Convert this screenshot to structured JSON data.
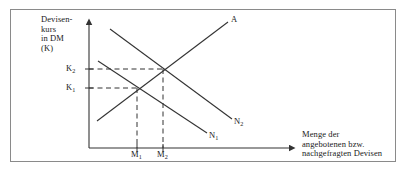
{
  "figure": {
    "kind": "economics-supply-demand-diagram",
    "frame_color": "#8a8a8a",
    "line_color": "#333333",
    "background": "#ffffff"
  },
  "axes": {
    "y_title_lines": [
      "Devisen-",
      "kurs",
      "in DM",
      "(K)"
    ],
    "y_title": "Devisen-\nkurs\nin DM\n(K)",
    "x_title_lines": [
      "Menge der",
      "angebotenen bzw.",
      "nachgefragten Devisen"
    ],
    "x_title": "Menge der\nangebotenen bzw.\nnachgefragten Devisen",
    "origin": {
      "x": 89,
      "y": 148
    },
    "y_axis_top": {
      "x": 89,
      "y": 20
    },
    "x_axis_right": {
      "x": 294,
      "y": 148
    },
    "arrowheads": [
      "y-axis-top",
      "x-axis-right"
    ]
  },
  "ticks": {
    "y": [
      {
        "label": "K",
        "sub": "2",
        "value_y": 69
      },
      {
        "label": "K",
        "sub": "1",
        "value_y": 88
      }
    ],
    "x": [
      {
        "label": "M",
        "sub": "1",
        "value_x": 137
      },
      {
        "label": "M",
        "sub": "2",
        "value_x": 163
      }
    ]
  },
  "curves": [
    {
      "name": "supply",
      "label": "A",
      "label_sub": "",
      "description": "upward sloping supply curve (Angebot)",
      "from": {
        "x": 97,
        "y": 121
      },
      "to": {
        "x": 228,
        "y": 22
      }
    },
    {
      "name": "demand-1",
      "label": "N",
      "label_sub": "1",
      "description": "original downward sloping demand curve",
      "from": {
        "x": 98,
        "y": 61
      },
      "to": {
        "x": 207,
        "y": 133
      }
    },
    {
      "name": "demand-2",
      "label": "N",
      "label_sub": "2",
      "description": "shifted-out downward sloping demand curve",
      "from": {
        "x": 110,
        "y": 29
      },
      "to": {
        "x": 232,
        "y": 119
      }
    }
  ],
  "equilibria": [
    {
      "name": "equilibrium-1",
      "x": 137,
      "y": 88,
      "price_tick": "K1",
      "quantity_tick": "M1"
    },
    {
      "name": "equilibrium-2",
      "x": 163,
      "y": 69,
      "price_tick": "K2",
      "quantity_tick": "M2"
    }
  ],
  "guides": {
    "style": "dashed",
    "horizontal": [
      {
        "from": {
          "x": 89,
          "y": 88
        },
        "to": {
          "x": 137,
          "y": 88
        }
      },
      {
        "from": {
          "x": 89,
          "y": 69
        },
        "to": {
          "x": 163,
          "y": 69
        }
      }
    ],
    "vertical": [
      {
        "from": {
          "x": 137,
          "y": 88
        },
        "to": {
          "x": 137,
          "y": 148
        }
      },
      {
        "from": {
          "x": 163,
          "y": 69
        },
        "to": {
          "x": 163,
          "y": 148
        }
      }
    ]
  }
}
